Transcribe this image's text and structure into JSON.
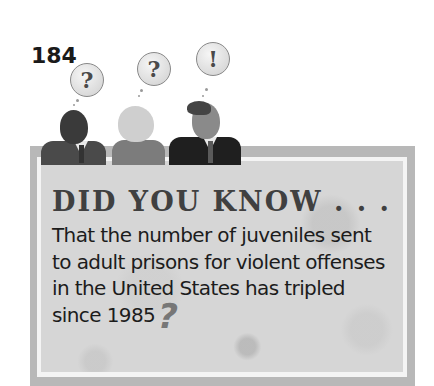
{
  "page": {
    "number": "184"
  },
  "illustration": {
    "figures": [
      {
        "name": "man-left",
        "thought_icon": "question-mark-icon",
        "thought_glyph": "?"
      },
      {
        "name": "woman-middle",
        "thought_icon": "question-mark-icon",
        "thought_glyph": "?"
      },
      {
        "name": "man-right",
        "thought_icon": "lightbulb-icon",
        "thought_glyph": "!"
      }
    ]
  },
  "callout": {
    "heading": "DID YOU KNOW . . .",
    "lines": [
      "That the number of juveniles sent",
      "to adult prisons for violent offenses",
      "in the United States has tripled",
      "since 1985"
    ],
    "end_glyph": "?"
  },
  "colors": {
    "frame": "#b8b8b8",
    "panel": "#d6d6d6",
    "heading": "#404040",
    "text": "#1c1c1c"
  }
}
